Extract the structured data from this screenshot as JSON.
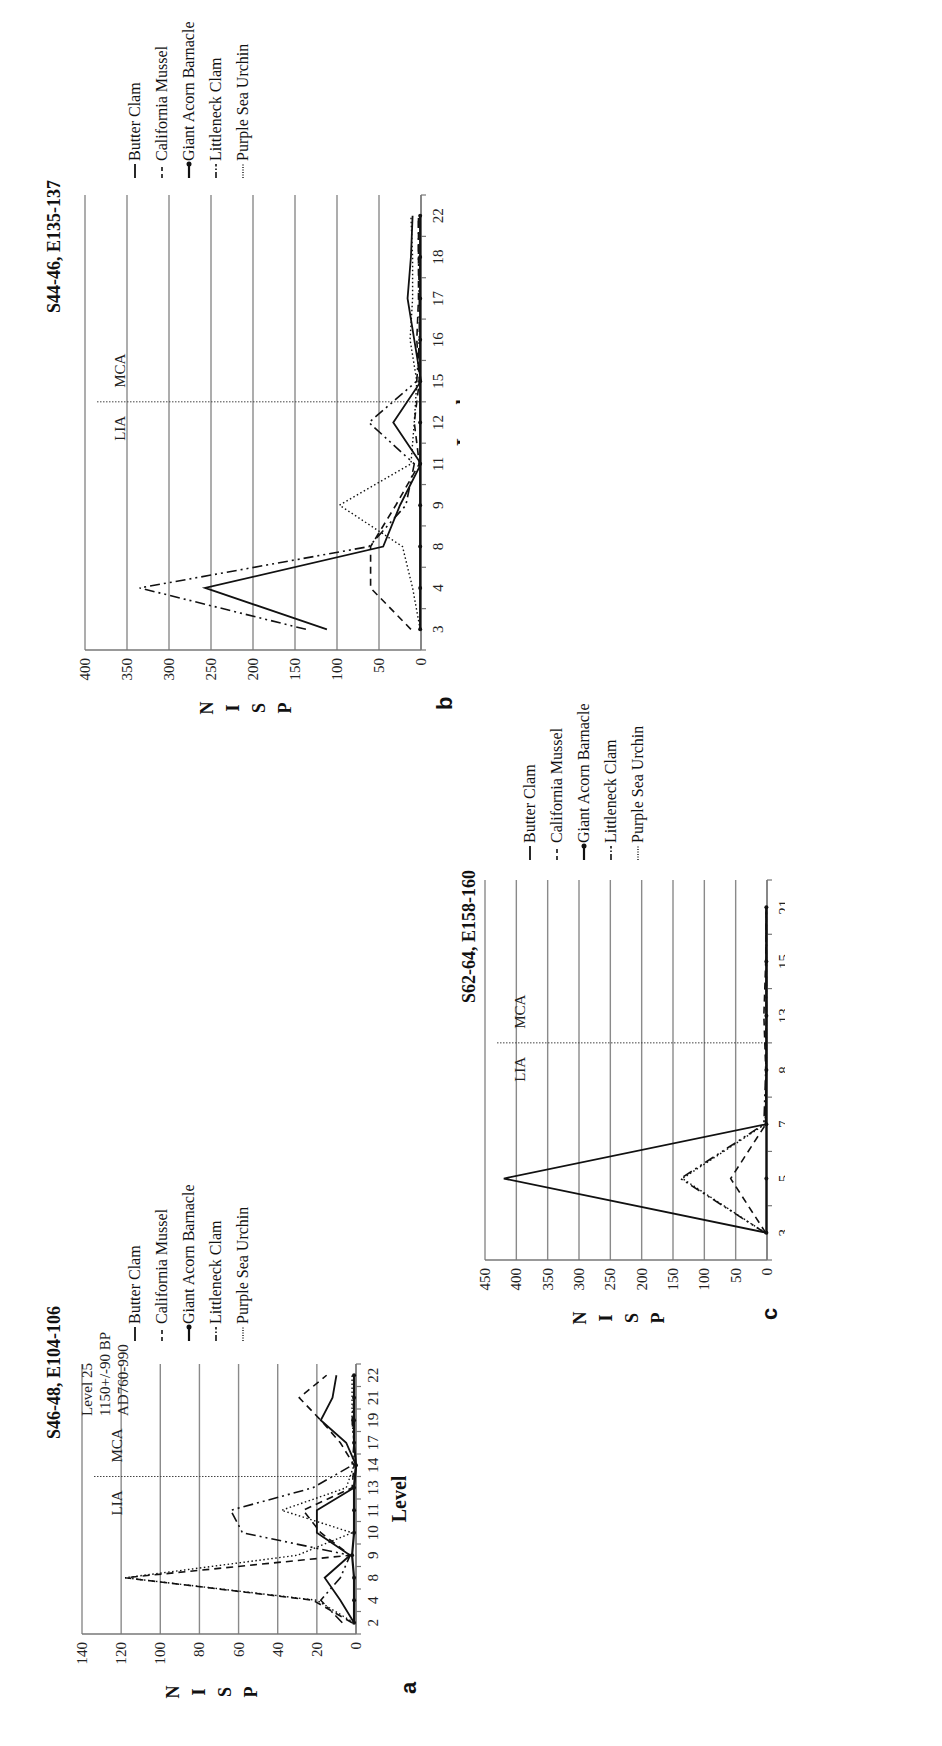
{
  "figure": {
    "panels": [
      {
        "letter": "a",
        "title": "S46-48, E104-106",
        "annotation": [
          "Level 25",
          "1150+/-90 BP",
          "AD760-990"
        ],
        "ylabel": "NISP",
        "xlabel": "Level",
        "period_labels": {
          "left": "LIA",
          "right": "MCA"
        },
        "legend": [
          "Butter Clam",
          "California Mussel",
          "Giant Acorn Barnacle",
          "Littleneck Clam",
          "Purple Sea Urchin"
        ]
      },
      {
        "letter": "b",
        "title": "S44-46, E135-137",
        "ylabel": "NISP",
        "xlabel": "Level",
        "period_labels": {
          "left": "LIA",
          "right": "MCA"
        },
        "legend": [
          "Butter Clam",
          "California Mussel",
          "Giant Acorn Barnacle",
          "Littleneck Clam",
          "Purple Sea Urchin"
        ]
      },
      {
        "letter": "c",
        "title": "S62-64, E158-160",
        "ylabel": "NISP",
        "xlabel": "Level",
        "period_labels": {
          "left": "LIA",
          "right": "MCA"
        },
        "legend": [
          "Butter Clam",
          "California Mussel",
          "Giant Acorn Barnacle",
          "Littleneck Clam",
          "Purple Sea Urchin"
        ]
      }
    ]
  },
  "chart_data": [
    {
      "type": "line",
      "panel": "a",
      "title": "S46-48, E104-106",
      "xlabel": "Level",
      "ylabel": "NISP",
      "categories": [
        "2",
        "4",
        "8",
        "9",
        "10",
        "11",
        "13",
        "14",
        "17",
        "19",
        "21",
        "22"
      ],
      "ylim": [
        0,
        140
      ],
      "yticks": [
        0,
        20,
        40,
        60,
        80,
        100,
        120,
        140
      ],
      "grid": true,
      "divider_between": [
        "13",
        "14"
      ],
      "annotations": [
        "LIA",
        "MCA",
        "Level 25",
        "1150+/-90 BP",
        "AD760-990"
      ],
      "legend_position": "right",
      "series": [
        {
          "name": "Butter Clam",
          "style": "solid",
          "values": [
            1,
            8,
            16,
            3,
            20,
            20,
            1,
            0,
            5,
            18,
            12,
            10
          ]
        },
        {
          "name": "California Mussel",
          "style": "dashed",
          "values": [
            2,
            22,
            118,
            3,
            18,
            27,
            2,
            1,
            8,
            18,
            29,
            15
          ]
        },
        {
          "name": "Giant Acorn Barnacle",
          "style": "solid-dot",
          "values": [
            1,
            1,
            1,
            2,
            1,
            1,
            1,
            0,
            1,
            1,
            1,
            1
          ]
        },
        {
          "name": "Littleneck Clam",
          "style": "dash-dot",
          "values": [
            7,
            18,
            8,
            3,
            58,
            64,
            22,
            2,
            1,
            2,
            1,
            1
          ]
        },
        {
          "name": "Purple Sea Urchin",
          "style": "dotted",
          "values": [
            1,
            20,
            118,
            30,
            2,
            38,
            5,
            1,
            1,
            2,
            2,
            2
          ]
        }
      ]
    },
    {
      "type": "line",
      "panel": "b",
      "title": "S44-46, E135-137",
      "xlabel": "Level",
      "ylabel": "NISP",
      "categories": [
        "3",
        "4",
        "8",
        "9",
        "11",
        "12",
        "15",
        "16",
        "17",
        "18",
        "22"
      ],
      "ylim": [
        0,
        400
      ],
      "yticks": [
        0,
        50,
        100,
        150,
        200,
        250,
        300,
        350,
        400
      ],
      "grid": true,
      "divider_between": [
        "12",
        "15"
      ],
      "annotations": [
        "LIA",
        "MCA"
      ],
      "legend_position": "right",
      "series": [
        {
          "name": "Butter Clam",
          "style": "solid",
          "values": [
            112,
            257,
            45,
            25,
            0,
            33,
            0,
            8,
            16,
            12,
            10
          ]
        },
        {
          "name": "California Mussel",
          "style": "dashed",
          "values": [
            12,
            60,
            60,
            30,
            2,
            8,
            2,
            5,
            3,
            3,
            3
          ]
        },
        {
          "name": "Giant Acorn Barnacle",
          "style": "solid-dot",
          "values": [
            1,
            1,
            1,
            1,
            1,
            1,
            1,
            1,
            1,
            1,
            1
          ]
        },
        {
          "name": "Littleneck Clam",
          "style": "dash-dot",
          "values": [
            137,
            335,
            62,
            18,
            8,
            62,
            5,
            2,
            2,
            3,
            3
          ]
        },
        {
          "name": "Purple Sea Urchin",
          "style": "dotted",
          "values": [
            1,
            10,
            22,
            97,
            12,
            8,
            5,
            13,
            10,
            10,
            12
          ]
        }
      ]
    },
    {
      "type": "line",
      "panel": "c",
      "title": "S62-64, E158-160",
      "xlabel": "Level",
      "ylabel": "NISP",
      "categories": [
        "3",
        "5",
        "7",
        "8",
        "13",
        "15",
        "21"
      ],
      "ylim": [
        0,
        450
      ],
      "yticks": [
        0,
        50,
        100,
        150,
        200,
        250,
        300,
        350,
        400,
        450
      ],
      "grid": true,
      "divider_between": [
        "8",
        "13"
      ],
      "annotations": [
        "LIA",
        "MCA"
      ],
      "legend_position": "right",
      "series": [
        {
          "name": "Butter Clam",
          "style": "solid",
          "values": [
            0,
            420,
            2,
            1,
            1,
            1,
            1
          ]
        },
        {
          "name": "California Mussel",
          "style": "dashed",
          "values": [
            2,
            58,
            2,
            2,
            5,
            2,
            1
          ]
        },
        {
          "name": "Giant Acorn Barnacle",
          "style": "solid-dot",
          "values": [
            1,
            1,
            1,
            1,
            1,
            1,
            1
          ]
        },
        {
          "name": "Littleneck Clam",
          "style": "dash-dot",
          "values": [
            3,
            138,
            5,
            2,
            1,
            1,
            1
          ]
        },
        {
          "name": "Purple Sea Urchin",
          "style": "dotted",
          "values": [
            3,
            135,
            3,
            1,
            1,
            1,
            1
          ]
        }
      ]
    }
  ]
}
